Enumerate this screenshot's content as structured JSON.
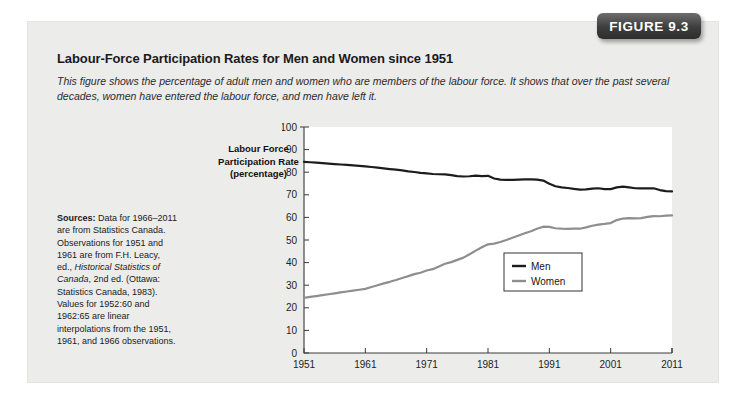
{
  "badge": {
    "label": "FIGURE 9.3"
  },
  "figure": {
    "title": "Labour-Force Participation Rates for Men and Women since 1951",
    "subtitle": "This figure shows the percentage of adult men and women who are members of the labour force. It shows that over the past several decades, women have entered the labour force, and men have left it."
  },
  "sources": {
    "label": "Sources:",
    "part1": " Data for 1966–2011 are from Statistics Canada. Observations for 1951 and 1961 are from F.H. Leacy, ed., ",
    "italic": "Historical Statistics of Canada",
    "part2": ", 2nd ed. (Ottawa: Statistics Canada, 1983). Values for 1952:60 and 1962:65 are linear interpolations from the 1951, 1961, and 1966 observations."
  },
  "axis_caption": {
    "line1": "Labour Force",
    "line2": "Participation Rate",
    "line3": "(percentage)"
  },
  "chart_data": {
    "type": "line",
    "title": "Labour-Force Participation Rates for Men and Women since 1951",
    "xlabel": "",
    "ylabel": "Labour Force Participation Rate (percentage)",
    "xlim": [
      1951,
      2011
    ],
    "ylim": [
      0,
      100
    ],
    "grid": false,
    "legend_position": "center-right",
    "xticks": [
      1951,
      1961,
      1971,
      1981,
      1991,
      2001,
      2011
    ],
    "xtick_labels": [
      "1951",
      "1961",
      "1971",
      "1981",
      "1991",
      "2001",
      "2011"
    ],
    "yticks": [
      0,
      10,
      20,
      30,
      40,
      50,
      60,
      70,
      80,
      90,
      100
    ],
    "ytick_labels": [
      "0",
      "10",
      "20",
      "30",
      "40",
      "50",
      "60",
      "70",
      "80",
      "90",
      "100"
    ],
    "x": [
      1951,
      1952,
      1953,
      1954,
      1955,
      1956,
      1957,
      1958,
      1959,
      1960,
      1961,
      1962,
      1963,
      1964,
      1965,
      1966,
      1967,
      1968,
      1969,
      1970,
      1971,
      1972,
      1973,
      1974,
      1975,
      1976,
      1977,
      1978,
      1979,
      1980,
      1981,
      1982,
      1983,
      1984,
      1985,
      1986,
      1987,
      1988,
      1989,
      1990,
      1991,
      1992,
      1993,
      1994,
      1995,
      1996,
      1997,
      1998,
      1999,
      2000,
      2001,
      2002,
      2003,
      2004,
      2005,
      2006,
      2007,
      2008,
      2009,
      2010,
      2011
    ],
    "series": [
      {
        "name": "Men",
        "color": "#1c1c1c",
        "values": [
          84.6,
          84.4,
          84.2,
          84.0,
          83.8,
          83.6,
          83.4,
          83.2,
          83.0,
          82.8,
          82.6,
          82.3,
          82.0,
          81.7,
          81.4,
          81.1,
          80.8,
          80.4,
          80.1,
          79.7,
          79.5,
          79.2,
          79.1,
          79.0,
          78.7,
          78.3,
          78.1,
          78.2,
          78.5,
          78.3,
          78.4,
          77.2,
          76.7,
          76.6,
          76.6,
          76.7,
          76.8,
          76.8,
          76.7,
          76.3,
          74.9,
          73.8,
          73.3,
          73.0,
          72.6,
          72.3,
          72.4,
          72.7,
          72.9,
          72.5,
          72.5,
          73.3,
          73.6,
          73.3,
          72.9,
          72.8,
          72.8,
          72.9,
          72.1,
          71.6,
          71.5
        ]
      },
      {
        "name": "Women",
        "color": "#8e8e8e",
        "values": [
          24.4,
          24.8,
          25.2,
          25.6,
          26.0,
          26.4,
          26.8,
          27.2,
          27.6,
          28.0,
          28.4,
          29.2,
          30.0,
          30.8,
          31.5,
          32.3,
          33.2,
          34.0,
          34.9,
          35.5,
          36.5,
          37.1,
          38.3,
          39.5,
          40.2,
          41.2,
          42.2,
          43.7,
          45.3,
          46.8,
          48.1,
          48.4,
          49.1,
          50.0,
          51.0,
          52.0,
          53.0,
          53.9,
          55.0,
          55.9,
          55.8,
          55.2,
          55.0,
          54.9,
          55.0,
          55.0,
          55.6,
          56.3,
          56.8,
          57.1,
          57.5,
          58.8,
          59.5,
          59.7,
          59.6,
          59.7,
          60.2,
          60.6,
          60.5,
          60.8,
          60.9
        ]
      }
    ],
    "legend": [
      {
        "name": "Men",
        "color": "#1c1c1c"
      },
      {
        "name": "Women",
        "color": "#8e8e8e"
      }
    ]
  }
}
